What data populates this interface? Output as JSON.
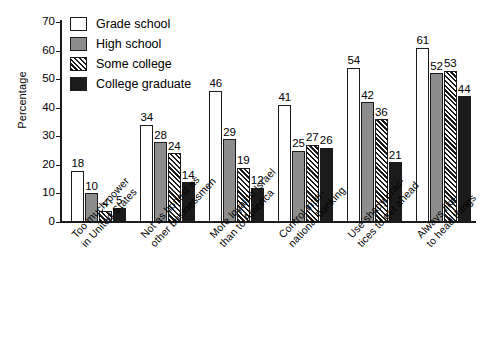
{
  "chart_data": {
    "type": "bar",
    "title": "",
    "subtitle": "",
    "xlabel": "",
    "ylabel": "Percentage",
    "ylim": [
      0,
      70
    ],
    "yticks": [
      0,
      10,
      20,
      30,
      40,
      50,
      60,
      70
    ],
    "grid": false,
    "legend_position": "top-left",
    "categories": [
      "Too much power in United States",
      "Not as honest as other businessmen",
      "More loyal to Israel than to America",
      "Control inter-national banking",
      "Use shady prac-tices to get ahead",
      "Always like to head things"
    ],
    "category_lines": [
      [
        "Too much power",
        "in United States"
      ],
      [
        "Not as honest as",
        "other businessmen"
      ],
      [
        "More loyal to Israel",
        "than to America"
      ],
      [
        "Control inter-",
        "national banking"
      ],
      [
        "Use shady prac-",
        "tices to get ahead"
      ],
      [
        "Always like",
        "to head things"
      ]
    ],
    "series": [
      {
        "name": "Grade school",
        "fill": "white",
        "color": "#ffffff",
        "values": [
          18,
          34,
          46,
          41,
          54,
          61
        ]
      },
      {
        "name": "High school",
        "fill": "gray",
        "color": "#8d8d8d",
        "values": [
          10,
          28,
          29,
          25,
          42,
          52
        ]
      },
      {
        "name": "Some college",
        "fill": "hatch",
        "color": "#1b1b1b",
        "values": [
          4,
          24,
          19,
          27,
          36,
          53
        ]
      },
      {
        "name": "College graduate",
        "fill": "black",
        "color": "#1b1b1b",
        "values": [
          5,
          14,
          12,
          26,
          21,
          44
        ]
      }
    ]
  }
}
